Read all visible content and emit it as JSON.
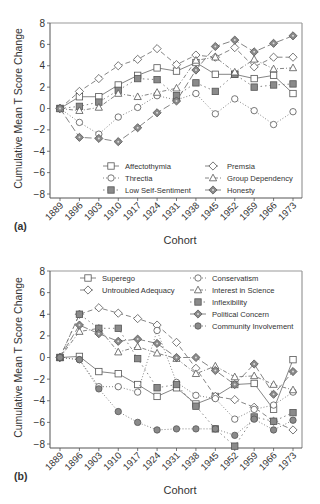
{
  "chart_data": [
    {
      "panel": "(a)",
      "type": "line",
      "title": "",
      "xlabel": "Cohort",
      "ylabel": "Cumulative Mean T Score Change",
      "ylim": [
        -8,
        8
      ],
      "yticks": [
        8,
        6,
        4,
        2,
        0,
        -2,
        -4,
        -6,
        -8
      ],
      "grid": false,
      "legend_position": "lower right (inside)",
      "categories": [
        "1889",
        "1896",
        "1903",
        "1910",
        "1917",
        "1924",
        "1931",
        "1938",
        "1945",
        "1952",
        "1959",
        "1966",
        "1973"
      ],
      "series": [
        {
          "name": "Affectothymia",
          "marker": "square-open",
          "line": "solid",
          "values": [
            0,
            1.1,
            1.1,
            2.2,
            3.1,
            3.8,
            3.5,
            4.3,
            3.2,
            3.2,
            2.8,
            3.1,
            1.4
          ]
        },
        {
          "name": "Threctia",
          "marker": "circle-open",
          "line": "dotted",
          "values": [
            0,
            -1.3,
            -2.4,
            -0.8,
            0.1,
            1.2,
            0.8,
            1.4,
            -0.5,
            0.9,
            -0.2,
            -1.5,
            -0.3
          ]
        },
        {
          "name": "Low Self-Sentiment",
          "marker": "square-filled",
          "line": "dot-dash",
          "values": [
            0,
            0.2,
            0.6,
            1.7,
            2.8,
            2.7,
            1.2,
            2.4,
            1.6,
            3.2,
            2.0,
            2.2,
            2.3
          ]
        },
        {
          "name": "Premsia",
          "marker": "diamond-open",
          "line": "dashed",
          "values": [
            0,
            1.6,
            2.8,
            4.0,
            4.6,
            5.6,
            4.1,
            5.0,
            4.8,
            5.7,
            3.9,
            4.8,
            4.8
          ]
        },
        {
          "name": "Group Dependency",
          "marker": "triangle-open",
          "line": "dash-dot",
          "values": [
            0,
            -0.2,
            0.1,
            1.4,
            1.1,
            1.5,
            1.9,
            4.5,
            4.8,
            3.4,
            4.6,
            3.7,
            3.8
          ]
        },
        {
          "name": "Honesty",
          "marker": "diamond-filled",
          "line": "long-dash",
          "values": [
            0,
            -2.7,
            -2.8,
            -3.1,
            -1.8,
            -0.4,
            0.7,
            3.6,
            5.8,
            6.4,
            5.3,
            6.1,
            6.8
          ]
        }
      ]
    },
    {
      "panel": "(b)",
      "type": "line",
      "title": "",
      "xlabel": "Cohort",
      "ylabel": "Cumulative Mean T Score Change",
      "ylim": [
        -8,
        8
      ],
      "yticks": [
        8,
        6,
        4,
        2,
        0,
        -2,
        -4,
        -6,
        -8
      ],
      "grid": false,
      "legend_position": "upper (inside)",
      "categories": [
        "1889",
        "1896",
        "1903",
        "1910",
        "1917",
        "1924",
        "1931",
        "1938",
        "1945",
        "1952",
        "1959",
        "1966",
        "1973"
      ],
      "series": [
        {
          "name": "Superego",
          "marker": "square-open",
          "line": "solid",
          "values": [
            0,
            0.1,
            -1.3,
            -1.5,
            -2.5,
            -3.6,
            -2.8,
            -4.3,
            -3.6,
            -2.5,
            -2.4,
            -4.8,
            -0.2
          ]
        },
        {
          "name": "Untroubled Adequacy",
          "marker": "diamond-open",
          "line": "dashed",
          "values": [
            0,
            4.0,
            4.6,
            4.1,
            3.6,
            3.0,
            1.4,
            -1.0,
            -3.6,
            -3.9,
            -4.6,
            -5.9,
            -6.7
          ]
        },
        {
          "name": "Conservatism",
          "marker": "circle-open",
          "line": "dotted",
          "values": [
            0,
            -0.2,
            -2.7,
            -2.7,
            -3.2,
            2.5,
            -2.3,
            -3.5,
            -3.8,
            -5.7,
            -4.8,
            -4.4,
            -3.2
          ]
        },
        {
          "name": "Interest in Science",
          "marker": "triangle-open",
          "line": "dash-dot",
          "values": [
            0,
            2.4,
            2.7,
            0.5,
            1.0,
            0.4,
            -0.1,
            -1.5,
            -0.8,
            -1.8,
            -1.7,
            -2.5,
            -3.0
          ]
        },
        {
          "name": "Inflexibility",
          "marker": "square-filled",
          "line": "dot-dash",
          "values": [
            0,
            4.0,
            2.7,
            2.7,
            -0.1,
            -2.8,
            -2.5,
            -4.5,
            -6.6,
            -8.2,
            -5.5,
            -5.9,
            -5.1
          ]
        },
        {
          "name": "Political Concern",
          "marker": "diamond-filled",
          "line": "long-dash",
          "values": [
            0,
            3.0,
            2.2,
            1.5,
            1.7,
            1.3,
            0.0,
            0.0,
            -1.2,
            -2.5,
            -0.6,
            -3.4,
            -1.3
          ]
        },
        {
          "name": "Community Involvement",
          "marker": "circle-filled",
          "line": "dotted",
          "values": [
            0,
            -0.2,
            -2.9,
            -5.0,
            -6.0,
            -6.7,
            -6.6,
            -6.6,
            -6.6,
            -7.2,
            -5.7,
            -6.7,
            -5.8
          ]
        }
      ]
    }
  ],
  "panels": [
    {
      "label": "(a)",
      "xlabel": "Cohort",
      "ylabel": "Cumulative Mean T Score Change",
      "legend": [
        "Affectothymia",
        "Threctia",
        "Low Self-Sentiment",
        "Premsia",
        "Group Dependency",
        "Honesty"
      ]
    },
    {
      "label": "(b)",
      "xlabel": "Cohort",
      "ylabel": "Cumulative Mean T Score Change",
      "legend": [
        "Superego",
        "Untroubled Adequacy",
        "Conservatism",
        "Interest in Science",
        "Inflexibility",
        "Political Concern",
        "Community Involvement"
      ]
    }
  ],
  "colors": {
    "axis": "#555555",
    "line": "#777777",
    "marker_fill": "#8a8a8a",
    "text": "#333333"
  }
}
